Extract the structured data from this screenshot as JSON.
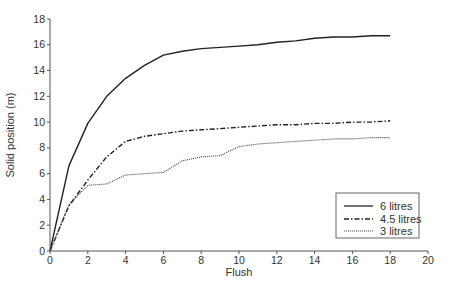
{
  "chart_data": {
    "type": "line",
    "title": "",
    "xlabel": "Flush",
    "ylabel": "Solid position (m)",
    "xlim": [
      0,
      20
    ],
    "ylim": [
      0,
      18
    ],
    "xticks": [
      0,
      2,
      4,
      6,
      8,
      10,
      12,
      14,
      16,
      18,
      20
    ],
    "yticks": [
      0,
      2,
      4,
      6,
      8,
      10,
      12,
      14,
      16,
      18
    ],
    "grid": false,
    "legend_position": "lower right",
    "series": [
      {
        "name": "6 litres",
        "style": "solid",
        "x": [
          0,
          1,
          2,
          3,
          4,
          5,
          6,
          7,
          8,
          9,
          10,
          11,
          12,
          13,
          14,
          15,
          16,
          17,
          18
        ],
        "values": [
          0,
          6.6,
          9.9,
          12.0,
          13.4,
          14.4,
          15.2,
          15.5,
          15.7,
          15.8,
          15.9,
          16.0,
          16.2,
          16.3,
          16.5,
          16.6,
          16.6,
          16.7,
          16.7
        ]
      },
      {
        "name": "4.5 litres",
        "style": "dash-dot",
        "x": [
          0,
          1,
          2,
          3,
          4,
          5,
          6,
          7,
          8,
          9,
          10,
          11,
          12,
          13,
          14,
          15,
          16,
          17,
          18
        ],
        "values": [
          0,
          3.5,
          5.5,
          7.3,
          8.5,
          8.9,
          9.1,
          9.3,
          9.4,
          9.5,
          9.6,
          9.7,
          9.8,
          9.8,
          9.9,
          9.9,
          10.0,
          10.0,
          10.1
        ]
      },
      {
        "name": "3 litres",
        "style": "dotted",
        "x": [
          0,
          1,
          2,
          3,
          4,
          5,
          6,
          7,
          8,
          9,
          10,
          11,
          12,
          13,
          14,
          15,
          16,
          17,
          18
        ],
        "values": [
          0,
          3.6,
          5.1,
          5.2,
          5.9,
          6.0,
          6.1,
          7.0,
          7.3,
          7.4,
          8.1,
          8.3,
          8.4,
          8.5,
          8.6,
          8.7,
          8.7,
          8.8,
          8.8
        ]
      }
    ]
  },
  "legend": {
    "items": [
      "6 litres",
      "4.5 litres",
      "3 litres"
    ]
  },
  "axes": {
    "xlabel": "Flush",
    "ylabel": "Solid position (m)"
  }
}
